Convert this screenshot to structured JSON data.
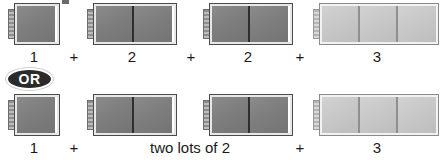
{
  "diagram": {
    "title_visible": false,
    "or_badge_label": "OR",
    "plus_symbol": "+",
    "colors": {
      "dark_rod": "#7e7e7e",
      "light_rod": "#c8c8c8",
      "rod_outline": "#4a4a4a",
      "rod_highlight": "#e8e8e8",
      "badge_background": "#2b2b2b",
      "badge_text": "#ffffff",
      "text": "#1a1a1a",
      "page_background": "#ffffff"
    },
    "rows": [
      {
        "id": "row-expanded",
        "expression": "1 + 2 + 2 + 3",
        "groups": [
          {
            "label": "1",
            "units": 1,
            "shade": "dark",
            "left": 8,
            "width": 52
          },
          {
            "label": "2",
            "units": 2,
            "shade": "dark",
            "left": 87,
            "width": 90
          },
          {
            "label": "2",
            "units": 2,
            "shade": "dark",
            "left": 203,
            "width": 90
          },
          {
            "label": "3",
            "units": 3,
            "shade": "light",
            "left": 313,
            "width": 128
          }
        ],
        "operators": [
          {
            "symbol": "+",
            "left": 66
          },
          {
            "symbol": "+",
            "left": 183
          },
          {
            "symbol": "+",
            "left": 292
          }
        ]
      },
      {
        "id": "row-grouped",
        "expression": "1 + two lots of 2 + 3",
        "groups": [
          {
            "label": "1",
            "units": 1,
            "shade": "dark",
            "left": 8,
            "width": 52
          },
          {
            "label": "two lots of 2",
            "units": 2,
            "shade": "dark",
            "left": 87,
            "width": 90
          },
          {
            "label": "",
            "units": 2,
            "shade": "dark",
            "left": 203,
            "width": 90
          },
          {
            "label": "3",
            "units": 3,
            "shade": "light",
            "left": 313,
            "width": 128
          }
        ],
        "operators": [
          {
            "symbol": "+",
            "left": 66
          },
          {
            "symbol": "+",
            "left": 292
          }
        ]
      }
    ]
  }
}
